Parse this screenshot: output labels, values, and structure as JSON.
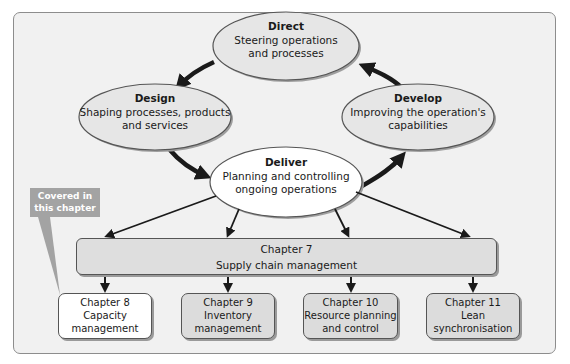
{
  "cycle": {
    "direct": {
      "title": "Direct",
      "line1": "Steering operations",
      "line2": "and processes"
    },
    "design": {
      "title": "Design",
      "line1": "Shaping processes, products",
      "line2": "and services"
    },
    "develop": {
      "title": "Develop",
      "line1": "Improving the operation's",
      "line2": "capabilities"
    },
    "deliver": {
      "title": "Deliver",
      "line1": "Planning and controlling",
      "line2": "ongoing operations"
    }
  },
  "supply_chain": {
    "chapter": "Chapter 7",
    "label": "Supply chain management"
  },
  "chapters": [
    {
      "chapter": "Chapter 8",
      "line1": "Capacity",
      "line2": "management",
      "highlighted": true
    },
    {
      "chapter": "Chapter 9",
      "line1": "Inventory",
      "line2": "management",
      "highlighted": false
    },
    {
      "chapter": "Chapter 10",
      "line1": "Resource planning",
      "line2": "and control",
      "highlighted": false
    },
    {
      "chapter": "Chapter 11",
      "line1": "Lean",
      "line2": "synchronisation",
      "highlighted": false
    }
  ],
  "callout": {
    "line1": "Covered in",
    "line2": "this chapter"
  },
  "colors": {
    "panel_bg": "#f1f1f1",
    "ellipse_fill": "#e4e4e4",
    "box_fill": "#dcdcdc",
    "highlight_fill": "#ffffff",
    "callout_bg": "#a3a3a3",
    "arrow": "#1a1a1a"
  }
}
